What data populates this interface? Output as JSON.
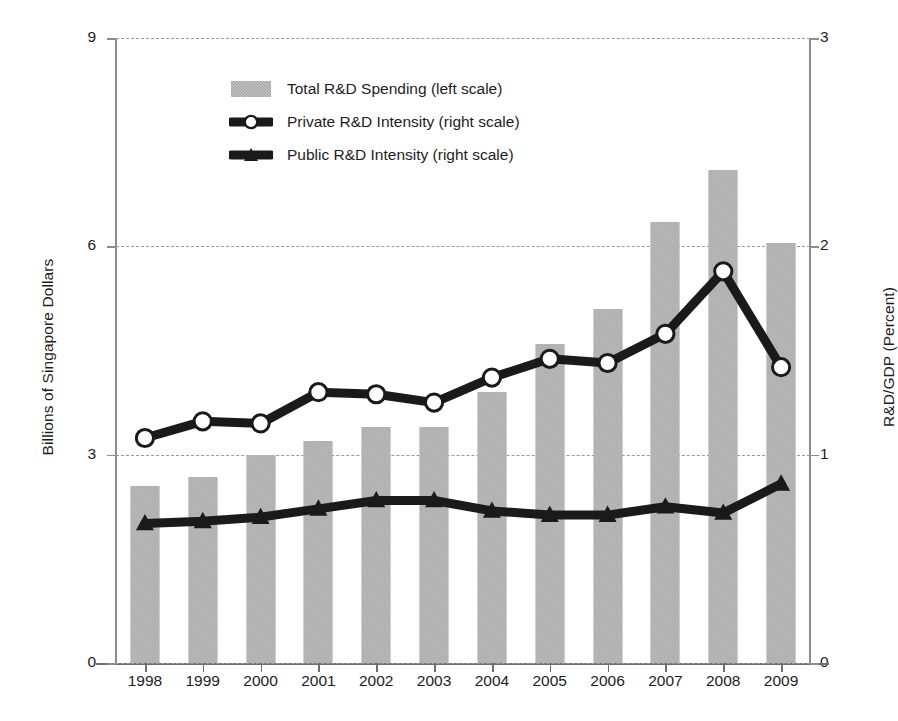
{
  "chart_data": {
    "type": "bar",
    "title": "",
    "subtitle": "",
    "categories": [
      "1998",
      "1999",
      "2000",
      "2001",
      "2002",
      "2003",
      "2004",
      "2005",
      "2006",
      "2007",
      "2008",
      "2009"
    ],
    "xlabel": "",
    "grid": true,
    "legend_position": "inside-top-center",
    "left_axis": {
      "label": "Billions of Singapore Dollars",
      "ticks": [
        "0",
        "3",
        "6",
        "9"
      ],
      "tick_values": [
        0,
        3,
        6,
        9
      ],
      "ylim": [
        0,
        9
      ]
    },
    "right_axis": {
      "label": "R&D/GDP (Percent)",
      "ticks": [
        "0",
        "1",
        "2",
        "3"
      ],
      "tick_values": [
        0,
        1,
        2,
        3
      ],
      "ylim": [
        0,
        3
      ]
    },
    "series": [
      {
        "name": "Total R&D Spending (left scale)",
        "type": "bar",
        "axis": "left",
        "color": "#a8a8a8",
        "values": [
          2.55,
          2.68,
          3.0,
          3.2,
          3.4,
          3.4,
          3.9,
          4.6,
          5.1,
          6.35,
          7.1,
          6.05
        ]
      },
      {
        "name": "Private R&D Intensity (right scale)",
        "type": "line",
        "axis": "right",
        "color": "#1a1a1a",
        "marker": "open-circle",
        "values": [
          1.08,
          1.16,
          1.15,
          1.3,
          1.29,
          1.25,
          1.37,
          1.46,
          1.44,
          1.58,
          1.88,
          1.42
        ]
      },
      {
        "name": "Public R&D Intensity (right scale)",
        "type": "line",
        "axis": "right",
        "color": "#1a1a1a",
        "marker": "filled-triangle",
        "values": [
          0.67,
          0.68,
          0.7,
          0.74,
          0.78,
          0.78,
          0.73,
          0.71,
          0.71,
          0.75,
          0.72,
          0.86
        ]
      }
    ]
  },
  "legend": {
    "items": [
      {
        "label": "Total R&D Spending (left scale)",
        "swatch": "bar-swatch-icon"
      },
      {
        "label": "Private R&D Intensity (right scale)",
        "swatch": "line-open-circle-icon"
      },
      {
        "label": "Public R&D Intensity (right scale)",
        "swatch": "line-filled-triangle-icon"
      }
    ]
  },
  "colors": {
    "bar_fill": "#a8a8a8",
    "line": "#1a1a1a",
    "gridline": "#9a9a9a",
    "axis": "#8d8d8d",
    "text": "#1d1d1d",
    "background": "#ffffff"
  }
}
